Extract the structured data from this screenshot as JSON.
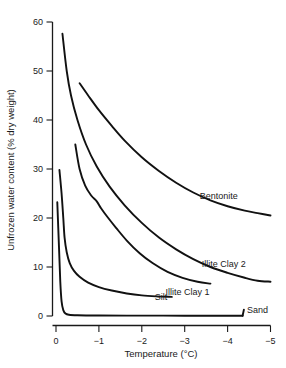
{
  "chart_data": {
    "type": "line",
    "title": "",
    "xlabel": "Temperature (°C)",
    "ylabel": "Unfrozen water content (% dry weight)",
    "xlim": [
      0,
      -5
    ],
    "ylim": [
      0,
      60
    ],
    "xticks": [
      "0",
      "−1",
      "−2",
      "−3",
      "−4",
      "−5"
    ],
    "yticks": [
      "0",
      "10",
      "20",
      "30",
      "40",
      "50",
      "60"
    ],
    "grid": false,
    "legend_position": "inline-right-of-curve",
    "series": [
      {
        "name": "Bentonite",
        "label": "Bentonite",
        "label_x": -3.35,
        "label_y": 24.5,
        "color": "#111111",
        "points": [
          [
            -0.55,
            47.5
          ],
          [
            -0.75,
            45.0
          ],
          [
            -1.0,
            42.0
          ],
          [
            -1.3,
            38.8
          ],
          [
            -1.6,
            35.8
          ],
          [
            -2.0,
            32.4
          ],
          [
            -2.4,
            29.6
          ],
          [
            -2.8,
            27.2
          ],
          [
            -3.2,
            25.2
          ],
          [
            -3.6,
            23.6
          ],
          [
            -4.0,
            22.4
          ],
          [
            -4.4,
            21.5
          ],
          [
            -4.7,
            21.0
          ],
          [
            -5.0,
            20.5
          ]
        ]
      },
      {
        "name": "Illite Clay 2",
        "label": "Illite Clay 2",
        "label_x": -3.4,
        "label_y": 10.6,
        "color": "#111111",
        "points": [
          [
            -0.15,
            57.6
          ],
          [
            -0.25,
            50.0
          ],
          [
            -0.35,
            45.0
          ],
          [
            -0.5,
            40.0
          ],
          [
            -0.7,
            35.0
          ],
          [
            -0.95,
            30.5
          ],
          [
            -1.25,
            26.4
          ],
          [
            -1.6,
            22.6
          ],
          [
            -2.0,
            19.0
          ],
          [
            -2.4,
            16.0
          ],
          [
            -2.8,
            13.6
          ],
          [
            -3.2,
            11.6
          ],
          [
            -3.6,
            10.0
          ],
          [
            -4.0,
            8.8
          ],
          [
            -4.4,
            7.8
          ],
          [
            -4.7,
            7.2
          ],
          [
            -5.0,
            7.0
          ]
        ]
      },
      {
        "name": "Illite Clay 1",
        "label": "Illite Clay 1",
        "label_x": -2.55,
        "label_y": 5.0,
        "color": "#111111",
        "points": [
          [
            -0.45,
            35.0
          ],
          [
            -0.55,
            30.0
          ],
          [
            -0.68,
            26.6
          ],
          [
            -0.82,
            24.6
          ],
          [
            -0.95,
            23.4
          ],
          [
            -1.05,
            22.0
          ],
          [
            -1.2,
            20.2
          ],
          [
            -1.4,
            18.0
          ],
          [
            -1.65,
            15.4
          ],
          [
            -1.95,
            12.8
          ],
          [
            -2.25,
            10.8
          ],
          [
            -2.6,
            9.0
          ],
          [
            -2.95,
            7.8
          ],
          [
            -3.3,
            7.0
          ],
          [
            -3.6,
            6.6
          ]
        ]
      },
      {
        "name": "Silt",
        "label": "Silt",
        "label_x": -2.3,
        "label_y": 3.9,
        "color": "#111111",
        "points": [
          [
            -0.08,
            29.8
          ],
          [
            -0.13,
            25.0
          ],
          [
            -0.17,
            20.0
          ],
          [
            -0.2,
            16.0
          ],
          [
            -0.25,
            13.0
          ],
          [
            -0.32,
            10.8
          ],
          [
            -0.42,
            9.2
          ],
          [
            -0.55,
            8.0
          ],
          [
            -0.75,
            6.8
          ],
          [
            -1.0,
            5.9
          ],
          [
            -1.3,
            5.2
          ],
          [
            -1.65,
            4.6
          ],
          [
            -2.0,
            4.2
          ],
          [
            -2.35,
            4.0
          ],
          [
            -2.7,
            3.9
          ]
        ]
      },
      {
        "name": "Sand",
        "label": "Sand",
        "label_x": -4.45,
        "label_y": 1.3,
        "color": "#111111",
        "points": [
          [
            -0.03,
            23.2
          ],
          [
            -0.07,
            14.0
          ],
          [
            -0.1,
            7.0
          ],
          [
            -0.13,
            3.0
          ],
          [
            -0.17,
            1.2
          ],
          [
            -0.22,
            0.5
          ],
          [
            -0.3,
            0.25
          ],
          [
            -0.5,
            0.15
          ],
          [
            -1.0,
            0.1
          ],
          [
            -2.0,
            0.08
          ],
          [
            -3.0,
            0.06
          ],
          [
            -4.0,
            0.05
          ],
          [
            -4.35,
            0.05
          ]
        ]
      }
    ]
  },
  "caption": {
    "text": ""
  }
}
